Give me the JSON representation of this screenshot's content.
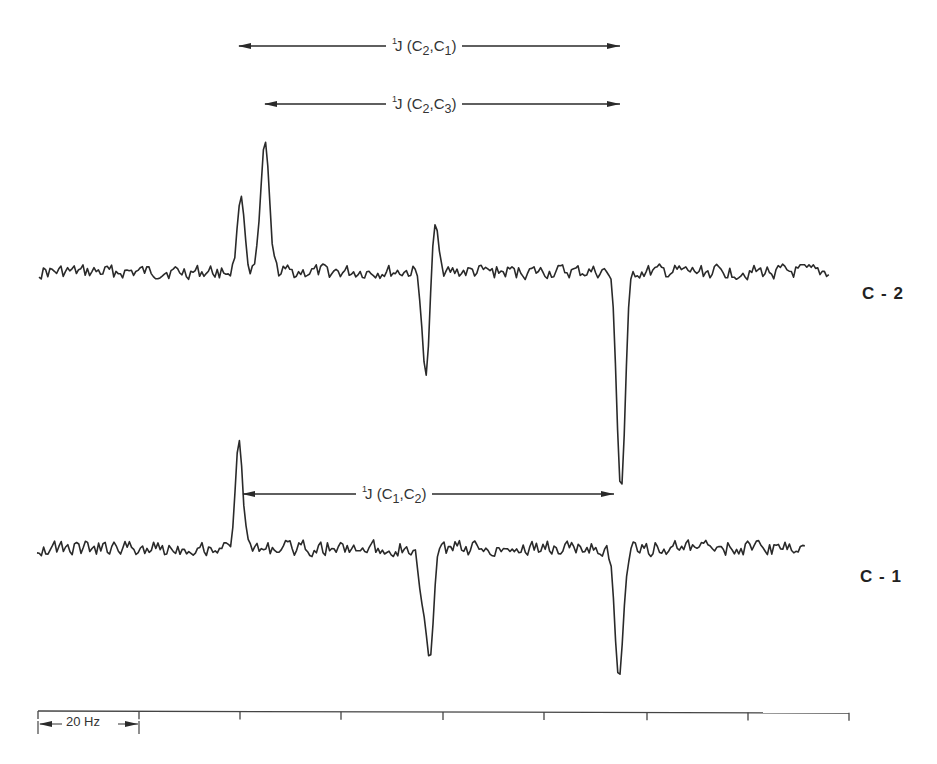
{
  "chart_data": {
    "type": "line",
    "title": "",
    "xlabel": "",
    "ylabel": "",
    "grid": false,
    "legend": null,
    "scale_bar": {
      "label": "20 Hz",
      "tick_spacing_px": 101.3
    },
    "x_axis_ticks_px": [
      38,
      139,
      240,
      341,
      443,
      544,
      647,
      748,
      849
    ],
    "series": [
      {
        "name": "C-2",
        "label": "C - 2",
        "baseline_y_px": 272,
        "x_range_px": [
          39,
          830
        ],
        "peaks": [
          {
            "x_px": 241,
            "direction": "up",
            "extreme_y_px": 196,
            "relative_height": 0.58
          },
          {
            "x_px": 265,
            "direction": "up",
            "extreme_y_px": 141,
            "relative_height": 1.0
          },
          {
            "x_px": 426,
            "direction": "down",
            "extreme_y_px": 378,
            "relative_height": -0.81
          },
          {
            "x_px": 435,
            "direction": "up",
            "extreme_y_px": 220,
            "relative_height": 0.4
          },
          {
            "x_px": 621,
            "direction": "down",
            "extreme_y_px": 490,
            "relative_height": -1.66
          }
        ],
        "noise_amplitude_px": 14
      },
      {
        "name": "C-1",
        "label": "C - 1",
        "baseline_y_px": 548,
        "x_range_px": [
          37,
          805
        ],
        "peaks": [
          {
            "x_px": 239,
            "direction": "up",
            "extreme_y_px": 440,
            "relative_height": 1.0
          },
          {
            "x_px": 422,
            "direction": "down",
            "extreme_y_px": 595,
            "relative_height": -0.44
          },
          {
            "x_px": 430,
            "direction": "down",
            "extreme_y_px": 655,
            "relative_height": -1.0
          },
          {
            "x_px": 619,
            "direction": "down",
            "extreme_y_px": 678,
            "relative_height": -1.2
          }
        ],
        "noise_amplitude_px": 15
      }
    ],
    "annotations": [
      {
        "text_prefix": "1",
        "text_main": "J (C",
        "sub1": "2",
        "sep": ",C",
        "sub2": "1",
        "close": ")",
        "full": "¹J(C2,C1)",
        "y_px": 46,
        "x_start_px": 239,
        "x_end_px": 620,
        "label_x_px": 392
      },
      {
        "text_prefix": "1",
        "text_main": "J (C",
        "sub1": "2",
        "sep": ",C",
        "sub2": "3",
        "close": ")",
        "full": "¹J(C2,C3)",
        "y_px": 104,
        "x_start_px": 265,
        "x_end_px": 620,
        "label_x_px": 392
      },
      {
        "text_prefix": "1",
        "text_main": "J (C",
        "sub1": "1",
        "sep": ",C",
        "sub2": "2",
        "close": ")",
        "full": "¹J(C1,C2)",
        "y_px": 494,
        "x_start_px": 243,
        "x_end_px": 614,
        "label_x_px": 362
      }
    ]
  },
  "labels": {
    "trace_top": "C - 2",
    "trace_bottom": "C - 1",
    "scale": "20 Hz",
    "ann1": {
      "sup": "1",
      "pre": "J (C",
      "s1": "2",
      "mid": ",C",
      "s2": "1",
      "post": ")"
    },
    "ann2": {
      "sup": "1",
      "pre": "J (C",
      "s1": "2",
      "mid": ",C",
      "s2": "3",
      "post": ")"
    },
    "ann3": {
      "sup": "1",
      "pre": "J (C",
      "s1": "1",
      "mid": ",C",
      "s2": "2",
      "post": ")"
    }
  },
  "colors": {
    "ink": "#2a2a2a",
    "background": "#ffffff"
  }
}
